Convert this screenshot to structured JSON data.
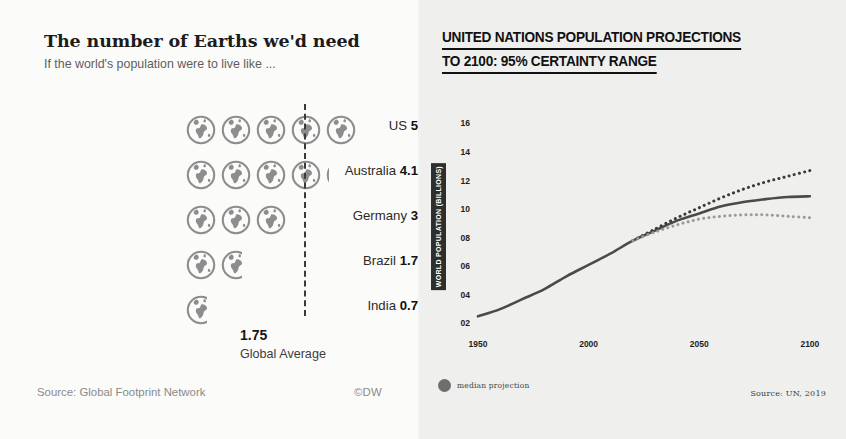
{
  "left_panel": {
    "title": "The number of Earths we'd need",
    "subtitle": "If the world's population were to live like ...",
    "rows": [
      {
        "country": "US",
        "value": "5",
        "earths": 5
      },
      {
        "country": "Australia",
        "value": "4.1",
        "earths": 4.1
      },
      {
        "country": "Germany",
        "value": "3",
        "earths": 3
      },
      {
        "country": "Brazil",
        "value": "1.7",
        "earths": 1.7
      },
      {
        "country": "India",
        "value": "0.7",
        "earths": 0.7
      }
    ],
    "average_value": "1.75",
    "average_caption": "Global Average",
    "source": "Source: Global Footprint Network",
    "copyright": "©DW",
    "icon_name": "earth-globe-icon"
  },
  "right_panel": {
    "title_line1": "UNITED NATIONS POPULATION PROJECTIONS",
    "title_line2": "TO 2100: 95% CERTAINTY RANGE",
    "legend_label": "median projection",
    "legend_color": "#6e6e6e",
    "source": "Source: UN, 2019"
  },
  "chart_data": {
    "type": "line",
    "title": "UNITED NATIONS POPULATION PROJECTIONS TO 2100: 95% CERTAINTY RANGE",
    "xlabel": "",
    "ylabel": "WORLD POPULATION (BILLIONS)",
    "xlim": [
      1950,
      2110
    ],
    "ylim": [
      1.4,
      16.8
    ],
    "grid": false,
    "legend_position": "bottom-left",
    "xticks": [
      1950,
      2000,
      2050,
      2100
    ],
    "xticklabels": [
      "1950",
      "2000",
      "2050",
      "2100"
    ],
    "yticks": [
      2,
      4,
      6,
      8,
      10,
      12,
      14,
      16
    ],
    "yticklabels": [
      "02",
      "04",
      "06",
      "08",
      "10",
      "12",
      "14",
      "16"
    ],
    "x": [
      1950,
      1960,
      1970,
      1980,
      1990,
      2000,
      2010,
      2020,
      2030,
      2040,
      2050,
      2060,
      2070,
      2080,
      2090,
      2100
    ],
    "series": [
      {
        "name": "median projection",
        "style": "solid",
        "color": "#4a4a4a",
        "values": [
          2.5,
          3.0,
          3.7,
          4.4,
          5.3,
          6.1,
          6.9,
          7.8,
          8.5,
          9.2,
          9.7,
          10.2,
          10.5,
          10.7,
          10.85,
          10.9
        ]
      },
      {
        "name": "upper 95% bound",
        "style": "dotted",
        "color": "#3c3c3c",
        "values": [
          null,
          null,
          null,
          null,
          null,
          null,
          null,
          7.8,
          8.6,
          9.4,
          10.1,
          10.8,
          11.4,
          11.9,
          12.3,
          12.7
        ]
      },
      {
        "name": "lower 95% bound",
        "style": "dotted",
        "color": "#9a9a9a",
        "values": [
          null,
          null,
          null,
          null,
          null,
          null,
          null,
          7.8,
          8.4,
          8.9,
          9.3,
          9.5,
          9.6,
          9.6,
          9.5,
          9.4
        ]
      }
    ]
  }
}
